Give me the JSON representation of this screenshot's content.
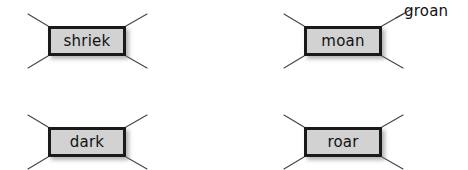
{
  "diagram": {
    "canvas": {
      "width": 468,
      "height": 170,
      "background": "#ffffff"
    },
    "style": {
      "box_fill": "#d2d2d2",
      "box_border": "#1a1a1a",
      "whisker_color": "#444444",
      "text_color": "#111111",
      "shadow_color": "#787878"
    },
    "nodes": [
      {
        "id": "shriek",
        "label": "shriek",
        "x": 48,
        "y": 26,
        "width": 78,
        "height": 30,
        "whiskers": [
          {
            "name": "top-left",
            "x1": 28,
            "y1": 14,
            "x2": 48,
            "y2": 26
          },
          {
            "name": "top-right",
            "x1": 126,
            "y1": 26,
            "x2": 147,
            "y2": 14
          },
          {
            "name": "bottom-left",
            "x1": 28,
            "y1": 68,
            "x2": 48,
            "y2": 56
          },
          {
            "name": "bottom-right",
            "x1": 126,
            "y1": 56,
            "x2": 147,
            "y2": 68
          }
        ]
      },
      {
        "id": "moan",
        "label": "moan",
        "x": 304,
        "y": 26,
        "width": 78,
        "height": 30,
        "whiskers": [
          {
            "name": "top-left",
            "x1": 284,
            "y1": 14,
            "x2": 304,
            "y2": 26
          },
          {
            "name": "top-right",
            "x1": 382,
            "y1": 26,
            "x2": 403,
            "y2": 14
          },
          {
            "name": "bottom-left",
            "x1": 284,
            "y1": 68,
            "x2": 304,
            "y2": 56
          },
          {
            "name": "bottom-right",
            "x1": 382,
            "y1": 56,
            "x2": 403,
            "y2": 68
          }
        ]
      },
      {
        "id": "dark",
        "label": "dark",
        "x": 48,
        "y": 127,
        "width": 78,
        "height": 30,
        "whiskers": [
          {
            "name": "top-left",
            "x1": 28,
            "y1": 115,
            "x2": 48,
            "y2": 127
          },
          {
            "name": "top-right",
            "x1": 126,
            "y1": 127,
            "x2": 147,
            "y2": 115
          },
          {
            "name": "bottom-left",
            "x1": 28,
            "y1": 169,
            "x2": 48,
            "y2": 157
          },
          {
            "name": "bottom-right",
            "x1": 126,
            "y1": 157,
            "x2": 147,
            "y2": 169
          }
        ]
      },
      {
        "id": "roar",
        "label": "roar",
        "x": 304,
        "y": 127,
        "width": 78,
        "height": 30,
        "whiskers": [
          {
            "name": "top-left",
            "x1": 284,
            "y1": 115,
            "x2": 304,
            "y2": 127
          },
          {
            "name": "top-right",
            "x1": 382,
            "y1": 127,
            "x2": 403,
            "y2": 115
          },
          {
            "name": "bottom-left",
            "x1": 284,
            "y1": 169,
            "x2": 304,
            "y2": 157
          },
          {
            "name": "bottom-right",
            "x1": 382,
            "y1": 157,
            "x2": 403,
            "y2": 169
          }
        ]
      }
    ],
    "annotations": [
      {
        "id": "groan",
        "label": "groan",
        "attached_to": "moan",
        "attached_whisker": "top-right",
        "x": 404,
        "y": 4,
        "leader": {
          "x1": 396,
          "y1": 18,
          "x2": 412,
          "y2": 9
        }
      }
    ]
  }
}
